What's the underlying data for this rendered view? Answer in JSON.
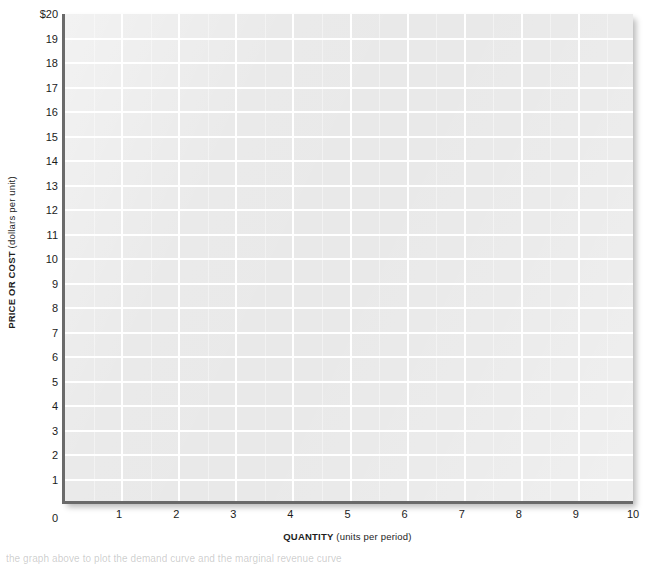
{
  "chart_data": {
    "type": "line",
    "title": "",
    "subtitle": "",
    "xlabel_bold": "QUANTITY",
    "xlabel_paren": "(units per period)",
    "ylabel_bold": "PRICE OR COST",
    "ylabel_paren": "(dollars per unit)",
    "xlim": [
      0,
      10
    ],
    "ylim": [
      0,
      20
    ],
    "x_ticks": [
      0,
      1,
      2,
      3,
      4,
      5,
      6,
      7,
      8,
      9,
      10
    ],
    "x_tick_labels": [
      "0",
      "1",
      "2",
      "3",
      "4",
      "5",
      "6",
      "7",
      "8",
      "9",
      "10"
    ],
    "y_ticks": [
      1,
      2,
      3,
      4,
      5,
      6,
      7,
      8,
      9,
      10,
      11,
      12,
      13,
      14,
      15,
      16,
      17,
      18,
      19,
      20
    ],
    "y_tick_labels": [
      "1",
      "2",
      "3",
      "4",
      "5",
      "6",
      "7",
      "8",
      "9",
      "10",
      "11",
      "12",
      "13",
      "14",
      "15",
      "16",
      "17",
      "18",
      "19",
      "$20"
    ],
    "y_zero_label": "0",
    "grid": true,
    "grid_major_x_step": 1,
    "grid_minor_x_step": 0.5,
    "grid_major_y_step": 1,
    "grid_color": "#ffffff",
    "plot_background": "#e9e9e9",
    "axis_color": "#6a6a6a",
    "legend": null,
    "series": [],
    "annotations": [],
    "note": "Blank graph grid — no data series plotted"
  },
  "footer": {
    "clipped_caption": "the graph above to plot the demand curve and the marginal revenue curve"
  }
}
